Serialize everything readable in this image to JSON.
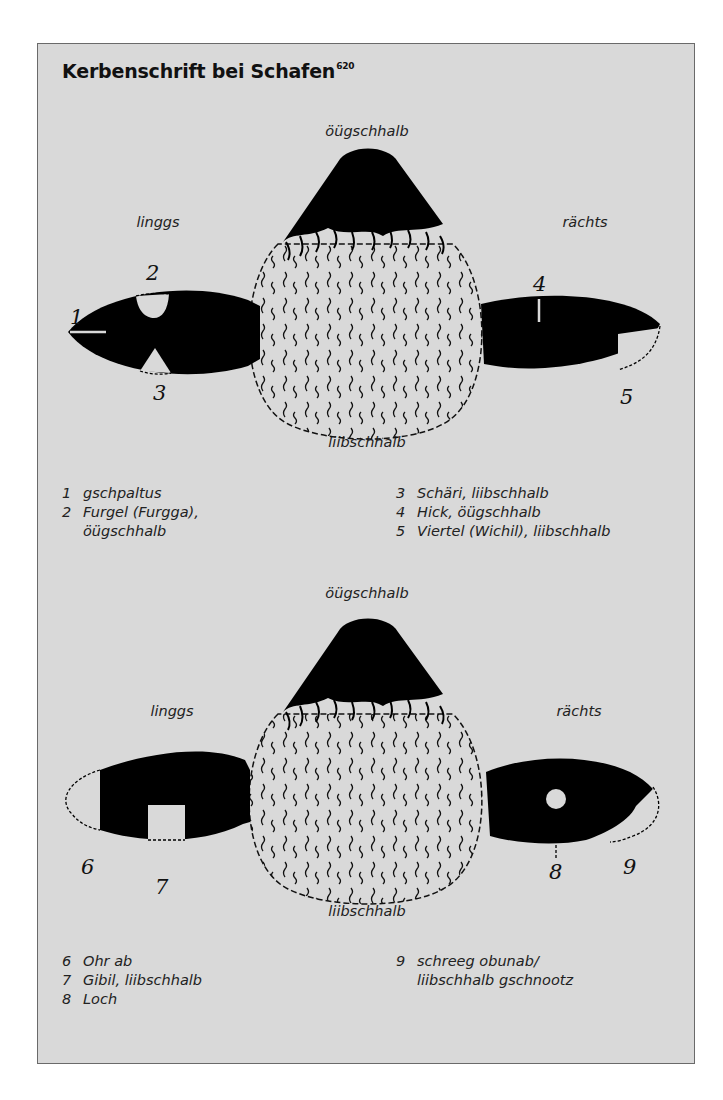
{
  "title": "Kerbenschrift bei Schafen",
  "title_footnote": "620",
  "colors": {
    "background": "#d9d9d9",
    "ink": "#000000",
    "border": "#6a6a6a"
  },
  "diagram_top": {
    "label_top": "öügschhalb",
    "label_bottom": "liibschhalb",
    "label_left": "linggs",
    "label_right": "rächts",
    "numbers": [
      "1",
      "2",
      "3",
      "4",
      "5"
    ]
  },
  "legend_top": {
    "left": [
      {
        "num": "1",
        "text": "gschpaltus"
      },
      {
        "num": "2",
        "text": "Furgel (Furgga),\nöügschhalb"
      }
    ],
    "right": [
      {
        "num": "3",
        "text": "Schäri, liibschhalb"
      },
      {
        "num": "4",
        "text": "Hick, öügschhalb"
      },
      {
        "num": "5",
        "text": "Viertel (Wichil), liibschhalb"
      }
    ]
  },
  "diagram_bottom": {
    "label_top": "öügschhalb",
    "label_bottom": "liibschhalb",
    "label_left": "linggs",
    "label_right": "rächts",
    "numbers": [
      "6",
      "7",
      "8",
      "9"
    ]
  },
  "legend_bottom": {
    "left": [
      {
        "num": "6",
        "text": "Ohr ab"
      },
      {
        "num": "7",
        "text": "Gibil, liibschhalb"
      },
      {
        "num": "8",
        "text": "Loch"
      }
    ],
    "right": [
      {
        "num": "9",
        "text": "schreeg obunab/\nliibschhalb gschnootz"
      }
    ]
  }
}
